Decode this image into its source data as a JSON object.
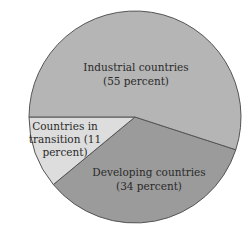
{
  "chart_data": {
    "type": "pie",
    "title": "",
    "categories": [
      "Industrial countries",
      "Developing countries",
      "Countries in transition"
    ],
    "values": [
      55,
      34,
      11
    ],
    "unit": "percent",
    "colors": [
      "#b5b5b5",
      "#9b9b9b",
      "#dddddd"
    ],
    "border_color": "#555555",
    "legend": "none (labels inside slices)",
    "labels": [
      {
        "line1": "Industrial countries",
        "line2": "(55 percent)"
      },
      {
        "line1": "Developing countries",
        "line2": "(34 percent)"
      },
      {
        "line1": "Countries in",
        "line2": "transition (11",
        "line3": "percent)"
      }
    ]
  }
}
